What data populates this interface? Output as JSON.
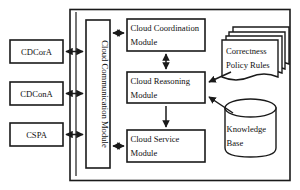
{
  "diagram": {
    "colors": {
      "stroke": "#1a1a1a",
      "fill": "#ffffff",
      "text": "#111111"
    },
    "external_agents": [
      {
        "id": "cdcora",
        "label": "CDCorA"
      },
      {
        "id": "cdcona",
        "label": "CDConA"
      },
      {
        "id": "cspa",
        "label": "CSPA"
      }
    ],
    "communication": {
      "label_line1": "Cloud Communication",
      "label_line2": "Module",
      "label_full": "Cloud Communication Module"
    },
    "modules": [
      {
        "id": "coordination",
        "line1": "Cloud Coordination",
        "line2": "Module"
      },
      {
        "id": "reasoning",
        "line1": "Cloud Reasoning",
        "line2": "Module"
      },
      {
        "id": "service",
        "line1": "Cloud Service",
        "line2": "Module"
      }
    ],
    "stores": [
      {
        "id": "policy-rules",
        "shape": "document-stack",
        "line1": "Correctness",
        "line2": "Policy Rules"
      },
      {
        "id": "knowledge-base",
        "shape": "cylinder",
        "line1": "Knowledge",
        "line2": "Base"
      }
    ]
  }
}
